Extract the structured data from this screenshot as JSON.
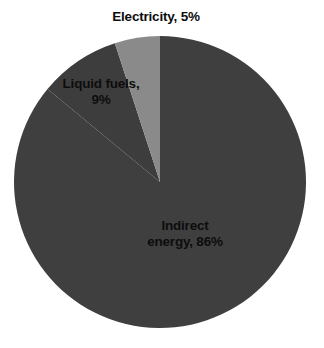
{
  "chart_data": {
    "type": "pie",
    "title": "",
    "categories": [
      "Indirect energy",
      "Liquid fuels",
      "Electricity"
    ],
    "values": [
      86,
      9,
      5
    ],
    "value_unit": "%",
    "colors": [
      "#3f3f3f",
      "#3d3d3d",
      "#8a8a8a"
    ],
    "background": "#ffffff",
    "label_color": "#0d0d0d",
    "legend": "none",
    "labels_position": "slice-and-callout",
    "start_angle_deg": 0,
    "direction": "clockwise",
    "slices": [
      {
        "name": "Indirect energy",
        "value": 86,
        "label_line1": "Indirect",
        "label_line2": "energy, 86%",
        "color": "#3f3f3f"
      },
      {
        "name": "Liquid fuels",
        "value": 9,
        "label_line1": "Liquid fuels,",
        "label_line2": "9%",
        "color": "#3d3d3d"
      },
      {
        "name": "Electricity",
        "value": 5,
        "label_line1": "Electricity, 5%",
        "label_line2": "",
        "color": "#8a8a8a"
      }
    ]
  },
  "labels": {
    "electricity": "Electricity, 5%",
    "liquid_fuels_line1": "Liquid fuels,",
    "liquid_fuels_line2": "9%",
    "indirect_line1": "Indirect",
    "indirect_line2": "energy, 86%"
  }
}
